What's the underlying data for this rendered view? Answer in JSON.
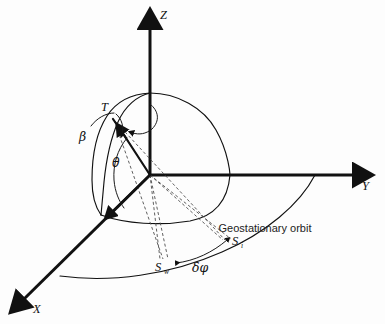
{
  "figure": {
    "kind": "3d-geometry-diagram",
    "background_color": "#fdfdfd",
    "line_color": "#111111",
    "dashed_line_color": "#4d4d4d"
  },
  "axes": [
    {
      "id": "x",
      "label": "X",
      "direction": "down-left",
      "arrow": true
    },
    {
      "id": "y",
      "label": "Y",
      "direction": "right",
      "arrow": true
    },
    {
      "id": "z",
      "label": "Z",
      "direction": "up",
      "arrow": true
    }
  ],
  "points": [
    {
      "id": "origin",
      "label": "",
      "x": 150,
      "y": 175
    },
    {
      "id": "T",
      "label": "T",
      "x": 112,
      "y": 117
    },
    {
      "id": "Si",
      "label": "S",
      "subscript": "i",
      "x": 228,
      "y": 243
    },
    {
      "id": "Sw",
      "label": "S",
      "subscript": "w",
      "x": 163,
      "y": 266
    }
  ],
  "angles": [
    {
      "id": "beta",
      "label": "β",
      "description": "angle at point T between local vertical and line of sight"
    },
    {
      "id": "theta",
      "label": "θ",
      "description": "angle at origin between OT direction and the X axis ground trace"
    },
    {
      "id": "delta-phi",
      "label": "δφ",
      "description": "longitude separation between Sw and Si on the geostationary orbit"
    }
  ],
  "annotations": [
    {
      "id": "geostationary-orbit",
      "text": "Geostationary orbit"
    }
  ],
  "curves": [
    {
      "id": "earth-limb-meridian",
      "description": "quarter-sphere meridian arc through Z pole"
    },
    {
      "id": "earth-limb-outline",
      "description": "sphere silhouette / terminator arc"
    },
    {
      "id": "earth-equator-arc",
      "description": "equatorial arc of the sphere in the XY plane"
    },
    {
      "id": "geostationary-orbit-arc",
      "description": "large outer arc representing geostationary orbit"
    }
  ]
}
